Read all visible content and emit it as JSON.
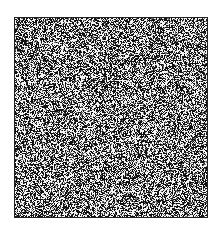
{
  "image": {
    "description": "random black-and-white noise texture square",
    "background_color": "#ffffff",
    "frame_color": "#222222",
    "noise": {
      "width": 194,
      "height": 201,
      "seed": 12345,
      "dark_color": "#111111",
      "light_color": "#f4f4f4",
      "light_ratio": 0.42
    }
  },
  "ghost": {
    "top": "",
    "bottom": ""
  }
}
